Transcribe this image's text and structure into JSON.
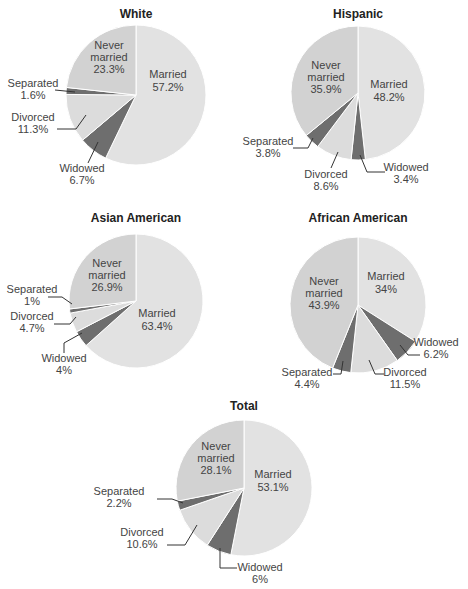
{
  "colors": {
    "Married": "#e2e2e2",
    "Never married": "#d2d2d2",
    "Divorced": "#dcdcdc",
    "Widowed": "#6e6e6e",
    "Separated": "#6e6e6e",
    "divider": "#ffffff"
  },
  "chart_data": [
    {
      "type": "pie",
      "title": "White",
      "categories": [
        "Married",
        "Widowed",
        "Divorced",
        "Separated",
        "Never married"
      ],
      "values": [
        57.2,
        6.7,
        11.3,
        1.6,
        23.3
      ],
      "labels": [
        "Married\n57.2%",
        "Widowed\n6.7%",
        "Divorced\n11.3%",
        "Separated\n1.6%",
        "Never\nmarried\n23.3%"
      ],
      "start_angle": "12 o'clock, clockwise"
    },
    {
      "type": "pie",
      "title": "Hispanic",
      "categories": [
        "Married",
        "Widowed",
        "Divorced",
        "Separated",
        "Never married"
      ],
      "values": [
        48.2,
        3.4,
        8.6,
        3.8,
        35.9
      ],
      "labels": [
        "Married\n48.2%",
        "Widowed\n3.4%",
        "Divorced\n8.6%",
        "Separated\n3.8%",
        "Never\nmarried\n35.9%"
      ],
      "start_angle": "12 o'clock, clockwise"
    },
    {
      "type": "pie",
      "title": "Asian American",
      "categories": [
        "Married",
        "Widowed",
        "Divorced",
        "Separated",
        "Never married"
      ],
      "values": [
        63.4,
        4.0,
        4.7,
        1.0,
        26.9
      ],
      "labels": [
        "Married\n63.4%",
        "Widowed\n4.0%",
        "Divorced\n4.7%",
        "Separated\n1.0%",
        "Never\nmarried\n26.9%"
      ],
      "start_angle": "12 o'clock, clockwise"
    },
    {
      "type": "pie",
      "title": "African American",
      "categories": [
        "Married",
        "Widowed",
        "Divorced",
        "Separated",
        "Never married"
      ],
      "values": [
        34,
        6.2,
        11.5,
        4.4,
        43.9
      ],
      "labels": [
        "Married\n34%",
        "Widowed\n6.2%",
        "Divorced\n11.5%",
        "Separated\n4.4%",
        "Never\nmarried\n43.9%"
      ],
      "start_angle": "12 o'clock, clockwise"
    },
    {
      "type": "pie",
      "title": "Total",
      "categories": [
        "Married",
        "Widowed",
        "Divorced",
        "Separated",
        "Never married"
      ],
      "values": [
        53.1,
        6.0,
        10.6,
        2.2,
        28.1
      ],
      "labels": [
        "Married\n53.1%",
        "Widowed\n6.0%",
        "Divorced\n10.6%",
        "Separated\n2.2%",
        "Never\nmarried\n28.1%"
      ],
      "start_angle": "12 o'clock, clockwise"
    }
  ]
}
